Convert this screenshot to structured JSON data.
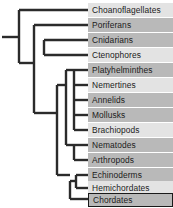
{
  "diagram": {
    "type": "cladogram",
    "background_color": "#ffffff",
    "branch_color": "#2b2b2b",
    "band_light_color": "#e3e3e3",
    "band_dark_color": "#b9b9b9",
    "highlight_border_color": "#1a1a1a",
    "taxa": [
      {
        "label": "Choanoflagellates",
        "band": "light",
        "y": 3,
        "highlighted": false
      },
      {
        "label": "Poriferans",
        "band": "dark",
        "y": 18,
        "highlighted": false
      },
      {
        "label": "Cnidarians",
        "band": "dark",
        "y": 33,
        "highlighted": false
      },
      {
        "label": "Ctenophores",
        "band": "light",
        "y": 48,
        "highlighted": false
      },
      {
        "label": "Platyhelminthes",
        "band": "dark",
        "y": 63,
        "highlighted": false
      },
      {
        "label": "Nemertines",
        "band": "light",
        "y": 78,
        "highlighted": false
      },
      {
        "label": "Annelids",
        "band": "dark",
        "y": 93,
        "highlighted": false
      },
      {
        "label": "Mollusks",
        "band": "dark",
        "y": 108,
        "highlighted": false
      },
      {
        "label": "Brachiopods",
        "band": "light",
        "y": 123,
        "highlighted": false
      },
      {
        "label": "Nematodes",
        "band": "dark",
        "y": 138,
        "highlighted": false
      },
      {
        "label": "Arthropods",
        "band": "dark",
        "y": 153,
        "highlighted": false
      },
      {
        "label": "Echinoderms",
        "band": "dark",
        "y": 168,
        "highlighted": false
      },
      {
        "label": "Hemichordates",
        "band": "light",
        "y": 181,
        "highlighted": false
      },
      {
        "label": "Chordates",
        "band": "dark",
        "y": 193,
        "highlighted": true
      }
    ]
  }
}
